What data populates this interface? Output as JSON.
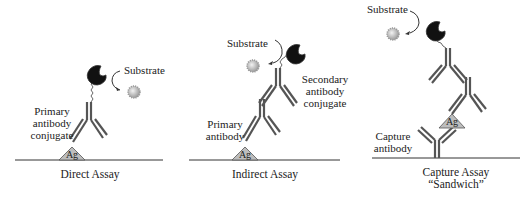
{
  "panels": [
    {
      "id": "direct",
      "caption": "Direct Assay",
      "labels": {
        "substrate": "Substrate",
        "primary_l1": "Primary",
        "primary_l2": "antibody",
        "primary_l3": "conjugate",
        "antigen": "Ag"
      }
    },
    {
      "id": "indirect",
      "caption": "Indirect Assay",
      "labels": {
        "substrate": "Substrate",
        "secondary_l1": "Secondary",
        "secondary_l2": "antibody",
        "secondary_l3": "conjugate",
        "primary_l1": "Primary",
        "primary_l2": "antibody",
        "antigen": "Ag"
      }
    },
    {
      "id": "sandwich",
      "caption_l1": "Capture Assay",
      "caption_l2": "“Sandwich”",
      "labels": {
        "substrate": "Substrate",
        "capture_l1": "Capture",
        "capture_l2": "antibody",
        "antigen": "Ag"
      }
    }
  ],
  "colors": {
    "antibody": "#555555",
    "antigen_fill": "#bdbdbd",
    "enzyme": "#111111",
    "substrate": "#bbbbbb",
    "surface": "#333333"
  }
}
